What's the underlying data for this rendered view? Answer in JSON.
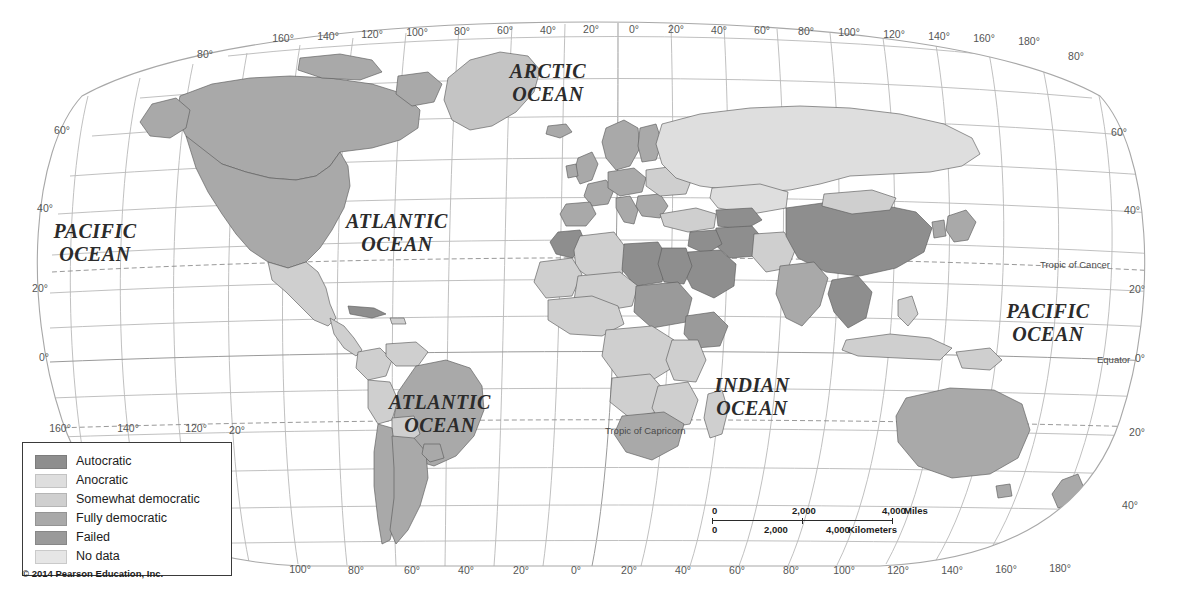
{
  "map": {
    "title": "World map of political regime types",
    "copyright": "© 2014 Pearson Education, Inc.",
    "ocean_labels": [
      {
        "name": "arctic-ocean",
        "line1": "ARCTIC",
        "line2": "OCEAN",
        "x": 548,
        "y": 78
      },
      {
        "name": "pacific-ocean-left",
        "line1": "PACIFIC",
        "line2": "OCEAN",
        "x": 95,
        "y": 238
      },
      {
        "name": "atlantic-ocean-north",
        "line1": "ATLANTIC",
        "line2": "OCEAN",
        "x": 397,
        "y": 228
      },
      {
        "name": "atlantic-ocean-south",
        "line1": "ATLANTIC",
        "line2": "OCEAN",
        "x": 440,
        "y": 409
      },
      {
        "name": "indian-ocean",
        "line1": "INDIAN",
        "line2": "OCEAN",
        "x": 752,
        "y": 392
      },
      {
        "name": "pacific-ocean-right",
        "line1": "PACIFIC",
        "line2": "OCEAN",
        "x": 1048,
        "y": 318
      }
    ],
    "reference_lines": [
      {
        "name": "tropic-of-cancer",
        "label": "Tropic of Cancer",
        "x": 1040,
        "y": 268
      },
      {
        "name": "equator",
        "label": "Equator",
        "x": 1097,
        "y": 363
      },
      {
        "name": "tropic-of-capricorn",
        "label": "Tropic of Capricorn",
        "x": 605,
        "y": 434
      }
    ],
    "top_longitude_labels": [
      {
        "label": "160°",
        "x": 283,
        "y": 42
      },
      {
        "label": "140°",
        "x": 328,
        "y": 40
      },
      {
        "label": "120°",
        "x": 372,
        "y": 38
      },
      {
        "label": "100°",
        "x": 417,
        "y": 36
      },
      {
        "label": "80°",
        "x": 462,
        "y": 35
      },
      {
        "label": "60°",
        "x": 505,
        "y": 34
      },
      {
        "label": "40°",
        "x": 548,
        "y": 34
      },
      {
        "label": "20°",
        "x": 591,
        "y": 33
      },
      {
        "label": "0°",
        "x": 634,
        "y": 33
      },
      {
        "label": "20°",
        "x": 676,
        "y": 33
      },
      {
        "label": "40°",
        "x": 719,
        "y": 34
      },
      {
        "label": "60°",
        "x": 762,
        "y": 34
      },
      {
        "label": "80°",
        "x": 806,
        "y": 35
      },
      {
        "label": "100°",
        "x": 849,
        "y": 36
      },
      {
        "label": "120°",
        "x": 894,
        "y": 38
      },
      {
        "label": "140°",
        "x": 939,
        "y": 40
      },
      {
        "label": "160°",
        "x": 984,
        "y": 42
      },
      {
        "label": "180°",
        "x": 1029,
        "y": 45
      }
    ],
    "bottom_longitude_labels": [
      {
        "label": "100°",
        "x": 300,
        "y": 573
      },
      {
        "label": "80°",
        "x": 356,
        "y": 574
      },
      {
        "label": "60°",
        "x": 412,
        "y": 574
      },
      {
        "label": "40°",
        "x": 466,
        "y": 574
      },
      {
        "label": "20°",
        "x": 521,
        "y": 574
      },
      {
        "label": "0°",
        "x": 576,
        "y": 574
      },
      {
        "label": "20°",
        "x": 629,
        "y": 574
      },
      {
        "label": "40°",
        "x": 683,
        "y": 574
      },
      {
        "label": "60°",
        "x": 737,
        "y": 574
      },
      {
        "label": "80°",
        "x": 791,
        "y": 574
      },
      {
        "label": "100°",
        "x": 844,
        "y": 574
      },
      {
        "label": "120°",
        "x": 898,
        "y": 574
      },
      {
        "label": "140°",
        "x": 952,
        "y": 574
      },
      {
        "label": "160°",
        "x": 1006,
        "y": 573
      },
      {
        "label": "180°",
        "x": 1060,
        "y": 572
      }
    ],
    "left_latitude_labels": [
      {
        "label": "80°",
        "x": 205,
        "y": 58
      },
      {
        "label": "60°",
        "x": 62,
        "y": 134
      },
      {
        "label": "40°",
        "x": 45,
        "y": 212
      },
      {
        "label": "20°",
        "x": 40,
        "y": 292
      },
      {
        "label": "0°",
        "x": 44,
        "y": 361
      },
      {
        "label": "20°",
        "x": 237,
        "y": 434
      },
      {
        "label": "40°",
        "x": 44,
        "y": 508
      }
    ],
    "left_extra_longitude_labels": [
      {
        "label": "160°",
        "x": 60,
        "y": 432
      },
      {
        "label": "140°",
        "x": 128,
        "y": 432
      },
      {
        "label": "120°",
        "x": 196,
        "y": 432
      }
    ],
    "right_latitude_labels": [
      {
        "label": "80°",
        "x": 1076,
        "y": 60
      },
      {
        "label": "60°",
        "x": 1119,
        "y": 136
      },
      {
        "label": "40°",
        "x": 1132,
        "y": 214
      },
      {
        "label": "20°",
        "x": 1137,
        "y": 293
      },
      {
        "label": "0°",
        "x": 1140,
        "y": 362
      },
      {
        "label": "20°",
        "x": 1137,
        "y": 436
      },
      {
        "label": "40°",
        "x": 1130,
        "y": 509
      }
    ]
  },
  "legend": {
    "title": "Regime type",
    "items": [
      {
        "label": "Autocratic",
        "color": "#8e8e8e"
      },
      {
        "label": "Anocratic",
        "color": "#dedede"
      },
      {
        "label": "Somewhat democratic",
        "color": "#cfcfcf"
      },
      {
        "label": "Fully democratic",
        "color": "#a9a9a9"
      },
      {
        "label": "Failed",
        "color": "#9a9a9a"
      },
      {
        "label": "No data",
        "color": "#e6e6e6"
      }
    ]
  },
  "scalebar": {
    "miles": {
      "unit": "Miles",
      "ticks": [
        {
          "label": "0",
          "pos": 0
        },
        {
          "label": "2,000",
          "pos": 90
        },
        {
          "label": "4,000",
          "pos": 180
        }
      ]
    },
    "kilometers": {
      "unit": "Kilometers",
      "ticks": [
        {
          "label": "0",
          "pos": 0
        },
        {
          "label": "2,000",
          "pos": 62
        },
        {
          "label": "4,000",
          "pos": 124
        }
      ]
    }
  },
  "colors": {
    "autocratic": "#8e8e8e",
    "anocratic": "#dedede",
    "somewhat_democratic": "#cfcfcf",
    "fully_democratic": "#a9a9a9",
    "failed": "#9a9a9a",
    "no_data": "#e6e6e6",
    "ocean": "#ffffff",
    "graticule": "#b9b9b9",
    "coastline": "#5d5d5d"
  }
}
